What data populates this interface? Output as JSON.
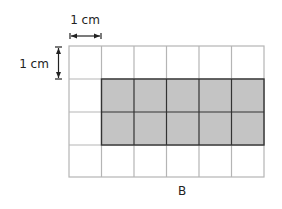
{
  "figure": {
    "label": "B",
    "scale_horizontal": "1 cm",
    "scale_vertical": "1 cm"
  },
  "grid": {
    "columns": 6,
    "rows": 4,
    "shaded_region": {
      "col_start": 1,
      "col_end": 6,
      "row_start": 1,
      "row_end": 3
    },
    "shaded_cells": 10
  },
  "colors": {
    "grid_line": "#b5b5b5",
    "shaded_fill": "#c4c4c4",
    "shaded_border": "#333333",
    "text": "#222222"
  }
}
